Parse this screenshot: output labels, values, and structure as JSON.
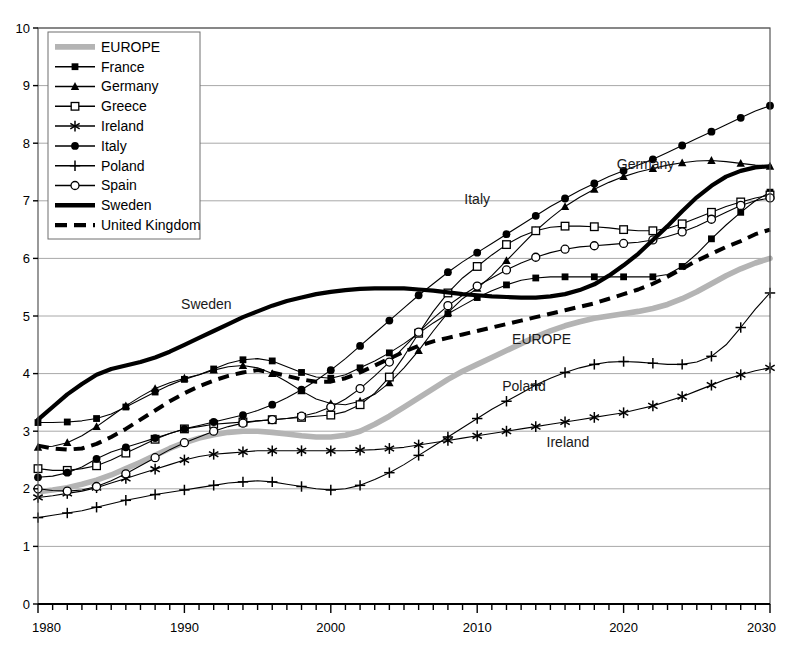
{
  "chart_data": {
    "type": "line",
    "title": "",
    "subtitle": "",
    "xlabel": "",
    "ylabel": "",
    "xlim": [
      1980,
      2030
    ],
    "ylim": [
      0,
      10
    ],
    "xticks": [
      1980,
      1990,
      2000,
      2010,
      2020,
      2030
    ],
    "xtick_labels": [
      "1980",
      "1990",
      "2000",
      "2010",
      "2020",
      "2030"
    ],
    "yticks": [
      0,
      1,
      2,
      3,
      4,
      5,
      6,
      7,
      8,
      9,
      10
    ],
    "ytick_labels": [
      "0",
      "1",
      "2",
      "3",
      "4",
      "5",
      "6",
      "7",
      "8",
      "9",
      "10"
    ],
    "xminor_step": 1,
    "grid": "horizontal",
    "legend_position": "top-left",
    "x": [
      1980,
      1981,
      1982,
      1983,
      1984,
      1985,
      1986,
      1987,
      1988,
      1989,
      1990,
      1991,
      1992,
      1993,
      1994,
      1995,
      1996,
      1997,
      1998,
      1999,
      2000,
      2001,
      2002,
      2003,
      2004,
      2005,
      2006,
      2007,
      2008,
      2009,
      2010,
      2011,
      2012,
      2013,
      2014,
      2015,
      2016,
      2017,
      2018,
      2019,
      2020,
      2021,
      2022,
      2023,
      2024,
      2025,
      2026,
      2027,
      2028,
      2029,
      2030
    ],
    "series": [
      {
        "name": "EUROPE",
        "marker": "none",
        "style": "thick-gray",
        "color": "#b4b4b4",
        "values": [
          1.95,
          1.98,
          2.02,
          2.08,
          2.15,
          2.24,
          2.35,
          2.46,
          2.58,
          2.7,
          2.8,
          2.88,
          2.94,
          2.98,
          3.0,
          3.0,
          2.98,
          2.95,
          2.92,
          2.9,
          2.9,
          2.93,
          3.0,
          3.12,
          3.26,
          3.42,
          3.58,
          3.74,
          3.9,
          4.04,
          4.16,
          4.28,
          4.4,
          4.52,
          4.64,
          4.74,
          4.83,
          4.9,
          4.96,
          5.0,
          5.04,
          5.08,
          5.13,
          5.2,
          5.3,
          5.42,
          5.56,
          5.7,
          5.82,
          5.92,
          6.0
        ]
      },
      {
        "name": "France",
        "marker": "filled-square",
        "style": "thin",
        "color": "#000000",
        "values": [
          3.15,
          3.15,
          3.16,
          3.18,
          3.22,
          3.3,
          3.42,
          3.55,
          3.68,
          3.8,
          3.9,
          3.98,
          4.08,
          4.18,
          4.24,
          4.26,
          4.22,
          4.12,
          4.02,
          3.94,
          3.92,
          3.98,
          4.1,
          4.22,
          4.36,
          4.52,
          4.7,
          4.88,
          5.04,
          5.18,
          5.32,
          5.44,
          5.54,
          5.62,
          5.66,
          5.68,
          5.68,
          5.68,
          5.68,
          5.68,
          5.68,
          5.68,
          5.68,
          5.72,
          5.86,
          6.08,
          6.34,
          6.58,
          6.8,
          7.0,
          7.15
        ]
      },
      {
        "name": "Germany",
        "marker": "filled-triangle",
        "style": "thin",
        "color": "#000000",
        "values": [
          2.72,
          2.74,
          2.8,
          2.92,
          3.08,
          3.26,
          3.44,
          3.6,
          3.74,
          3.84,
          3.92,
          3.98,
          4.06,
          4.12,
          4.14,
          4.1,
          4.0,
          3.86,
          3.7,
          3.56,
          3.48,
          3.46,
          3.52,
          3.64,
          3.84,
          4.1,
          4.4,
          4.74,
          5.06,
          5.3,
          5.48,
          5.7,
          5.96,
          6.22,
          6.48,
          6.7,
          6.9,
          7.06,
          7.2,
          7.32,
          7.42,
          7.5,
          7.56,
          7.62,
          7.66,
          7.69,
          7.7,
          7.68,
          7.65,
          7.62,
          7.6
        ]
      },
      {
        "name": "Greece",
        "marker": "open-square",
        "style": "thin",
        "color": "#000000",
        "values": [
          2.35,
          2.32,
          2.32,
          2.35,
          2.4,
          2.5,
          2.62,
          2.74,
          2.86,
          2.96,
          3.04,
          3.08,
          3.12,
          3.14,
          3.16,
          3.18,
          3.2,
          3.22,
          3.24,
          3.26,
          3.28,
          3.34,
          3.46,
          3.66,
          3.94,
          4.3,
          4.7,
          5.08,
          5.4,
          5.66,
          5.86,
          6.06,
          6.24,
          6.38,
          6.48,
          6.54,
          6.56,
          6.56,
          6.55,
          6.53,
          6.5,
          6.48,
          6.48,
          6.52,
          6.6,
          6.7,
          6.8,
          6.9,
          6.98,
          7.05,
          7.1
        ]
      },
      {
        "name": "Ireland",
        "marker": "asterisk",
        "style": "thin",
        "color": "#000000",
        "values": [
          1.85,
          1.88,
          1.92,
          1.96,
          2.02,
          2.1,
          2.18,
          2.26,
          2.34,
          2.42,
          2.5,
          2.56,
          2.6,
          2.62,
          2.64,
          2.66,
          2.66,
          2.66,
          2.66,
          2.66,
          2.66,
          2.66,
          2.67,
          2.68,
          2.7,
          2.72,
          2.76,
          2.8,
          2.84,
          2.88,
          2.92,
          2.96,
          3.0,
          3.04,
          3.08,
          3.12,
          3.16,
          3.2,
          3.24,
          3.28,
          3.32,
          3.38,
          3.44,
          3.52,
          3.6,
          3.7,
          3.8,
          3.9,
          3.98,
          4.05,
          4.1
        ]
      },
      {
        "name": "Italy",
        "marker": "filled-circle",
        "style": "thin",
        "color": "#000000",
        "values": [
          2.2,
          2.22,
          2.28,
          2.38,
          2.52,
          2.64,
          2.72,
          2.8,
          2.88,
          2.96,
          3.04,
          3.1,
          3.16,
          3.22,
          3.28,
          3.36,
          3.46,
          3.58,
          3.72,
          3.88,
          4.06,
          4.26,
          4.48,
          4.7,
          4.92,
          5.14,
          5.36,
          5.56,
          5.76,
          5.94,
          6.1,
          6.26,
          6.42,
          6.58,
          6.74,
          6.9,
          7.04,
          7.18,
          7.3,
          7.42,
          7.52,
          7.62,
          7.72,
          7.84,
          7.96,
          8.08,
          8.2,
          8.32,
          8.44,
          8.56,
          8.65
        ]
      },
      {
        "name": "Poland",
        "marker": "plus",
        "style": "thin",
        "color": "#000000",
        "values": [
          1.5,
          1.54,
          1.58,
          1.62,
          1.68,
          1.74,
          1.8,
          1.85,
          1.9,
          1.94,
          1.98,
          2.02,
          2.06,
          2.1,
          2.12,
          2.14,
          2.12,
          2.08,
          2.04,
          2.0,
          1.98,
          2.0,
          2.06,
          2.16,
          2.28,
          2.42,
          2.58,
          2.74,
          2.9,
          3.06,
          3.22,
          3.38,
          3.52,
          3.66,
          3.8,
          3.92,
          4.02,
          4.1,
          4.16,
          4.2,
          4.21,
          4.2,
          4.18,
          4.16,
          4.16,
          4.2,
          4.3,
          4.5,
          4.8,
          5.12,
          5.4
        ]
      },
      {
        "name": "Spain",
        "marker": "open-circle",
        "style": "thin",
        "color": "#000000",
        "values": [
          2.0,
          1.97,
          1.96,
          1.98,
          2.04,
          2.14,
          2.26,
          2.4,
          2.54,
          2.68,
          2.8,
          2.9,
          3.0,
          3.08,
          3.14,
          3.18,
          3.2,
          3.22,
          3.26,
          3.32,
          3.42,
          3.56,
          3.74,
          3.96,
          4.2,
          4.46,
          4.72,
          4.96,
          5.18,
          5.36,
          5.52,
          5.66,
          5.8,
          5.92,
          6.02,
          6.1,
          6.16,
          6.2,
          6.22,
          6.24,
          6.26,
          6.28,
          6.32,
          6.38,
          6.46,
          6.56,
          6.68,
          6.8,
          6.92,
          7.0,
          7.05
        ]
      },
      {
        "name": "Sweden",
        "marker": "none",
        "style": "thick-black",
        "color": "#000000",
        "values": [
          3.2,
          3.42,
          3.64,
          3.82,
          3.98,
          4.08,
          4.14,
          4.2,
          4.28,
          4.38,
          4.5,
          4.62,
          4.74,
          4.86,
          4.98,
          5.08,
          5.18,
          5.26,
          5.32,
          5.38,
          5.42,
          5.45,
          5.47,
          5.48,
          5.48,
          5.48,
          5.46,
          5.44,
          5.41,
          5.38,
          5.36,
          5.34,
          5.33,
          5.32,
          5.32,
          5.34,
          5.38,
          5.45,
          5.55,
          5.7,
          5.88,
          6.08,
          6.32,
          6.56,
          6.82,
          7.06,
          7.26,
          7.42,
          7.52,
          7.58,
          7.6
        ]
      },
      {
        "name": "United Kingdom",
        "marker": "none",
        "style": "dashed",
        "color": "#000000",
        "values": [
          2.75,
          2.7,
          2.68,
          2.7,
          2.78,
          2.9,
          3.04,
          3.2,
          3.36,
          3.52,
          3.66,
          3.78,
          3.88,
          3.96,
          4.02,
          4.06,
          4.02,
          3.96,
          3.9,
          3.86,
          3.86,
          3.92,
          4.02,
          4.14,
          4.26,
          4.38,
          4.48,
          4.56,
          4.62,
          4.68,
          4.74,
          4.8,
          4.86,
          4.92,
          4.98,
          5.04,
          5.1,
          5.16,
          5.22,
          5.3,
          5.38,
          5.46,
          5.56,
          5.68,
          5.82,
          5.96,
          6.08,
          6.2,
          6.3,
          6.42,
          6.5
        ]
      }
    ],
    "annotations": [
      {
        "text": "Sweden",
        "x": 1991.5,
        "y": 5.13,
        "name": "annotation-sweden"
      },
      {
        "text": "Italy",
        "x": 2010.0,
        "y": 6.95,
        "name": "annotation-italy"
      },
      {
        "text": "Germany",
        "x": 2021.5,
        "y": 7.55,
        "name": "annotation-germany"
      },
      {
        "text": "EUROPE",
        "x": 2014.4,
        "y": 4.52,
        "name": "annotation-europe"
      },
      {
        "text": "Poland",
        "x": 2013.2,
        "y": 3.7,
        "name": "annotation-poland"
      },
      {
        "text": "Ireland",
        "x": 2016.2,
        "y": 2.72,
        "name": "annotation-ireland"
      }
    ],
    "legend": [
      {
        "label": "EUROPE",
        "marker": "none",
        "style": "thick-gray"
      },
      {
        "label": "France",
        "marker": "filled-square",
        "style": "thin"
      },
      {
        "label": "Germany",
        "marker": "filled-triangle",
        "style": "thin"
      },
      {
        "label": "Greece",
        "marker": "open-square",
        "style": "thin"
      },
      {
        "label": "Ireland",
        "marker": "asterisk",
        "style": "thin"
      },
      {
        "label": "Italy",
        "marker": "filled-circle",
        "style": "thin"
      },
      {
        "label": "Poland",
        "marker": "plus",
        "style": "thin"
      },
      {
        "label": "Spain",
        "marker": "open-circle",
        "style": "thin"
      },
      {
        "label": "Sweden",
        "marker": "none",
        "style": "thick-black"
      },
      {
        "label": "United Kingdom",
        "marker": "none",
        "style": "dashed"
      }
    ]
  }
}
